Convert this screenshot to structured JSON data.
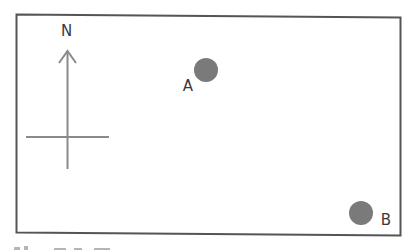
{
  "diagram": {
    "compass": {
      "label": "N",
      "icon": "north-arrow-icon"
    },
    "points": [
      {
        "label": "A",
        "marker": "filled-circle"
      },
      {
        "label": "B",
        "marker": "filled-circle"
      }
    ],
    "colors": {
      "border": "#555555",
      "compass": "#8a8a8a",
      "marker": "#7a7a7a",
      "text": "#3a3a3a"
    }
  }
}
